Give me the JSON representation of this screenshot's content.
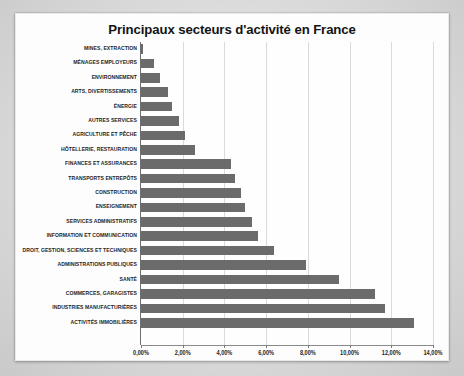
{
  "chart_data": {
    "type": "bar",
    "orientation": "horizontal",
    "title": "Principaux secteurs d'activité en France",
    "xlabel": "",
    "ylabel": "",
    "xlim": [
      0,
      14
    ],
    "xtick_labels": [
      "0,00%",
      "2,00%",
      "4,00%",
      "6,00%",
      "8,00%",
      "10,00%",
      "12,00%",
      "14,00%"
    ],
    "xtick_values": [
      0,
      2,
      4,
      6,
      8,
      10,
      12,
      14
    ],
    "grid": true,
    "legend": false,
    "value_suffix": "%",
    "decimal_separator": ",",
    "bar_color": "#6b6b6b",
    "categories": [
      "MINES, EXTRACTION",
      "MÉNAGES EMPLOYEURS",
      "ENVIRONNEMENT",
      "ARTS, DIVERTISSEMENTS",
      "ÉNERGIE",
      "AUTRES SERVICES",
      "AGRICULTURE ET PÊCHE",
      "HÔTELLERIE, RESTAURATION",
      "FINANCES ET ASSURANCES",
      "TRANSPORTS ENTREPÔTS",
      "CONSTRUCTION",
      "ENSEIGNEMENT",
      "SERVICES ADMINISTRATIFS",
      "INFORMATION ET COMMUNICATION",
      "DROIT, GESTION, SCIENCES ET TECHNIQUES",
      "ADMINISTRATIONS PUBLIQUES",
      "SANTÉ",
      "COMMERCES, GARAGISTES",
      "INDUSTRIES MANUFACTURIÈRES",
      "ACTIVITÉS IMMOBILIÈRES"
    ],
    "values": [
      0.1,
      0.6,
      0.9,
      1.3,
      1.5,
      1.8,
      2.1,
      2.6,
      4.3,
      4.5,
      4.8,
      5.0,
      5.3,
      5.6,
      6.4,
      7.9,
      9.5,
      11.2,
      11.7,
      13.1
    ]
  },
  "colors": {
    "bar": "#6b6b6b",
    "grid": "#dadada",
    "axis": "#6e6e6e",
    "plot_background": "#fefefe",
    "frame_background": "#fdfdfd",
    "page_background": "#dcdcdc",
    "text": "#1d1d1d"
  }
}
